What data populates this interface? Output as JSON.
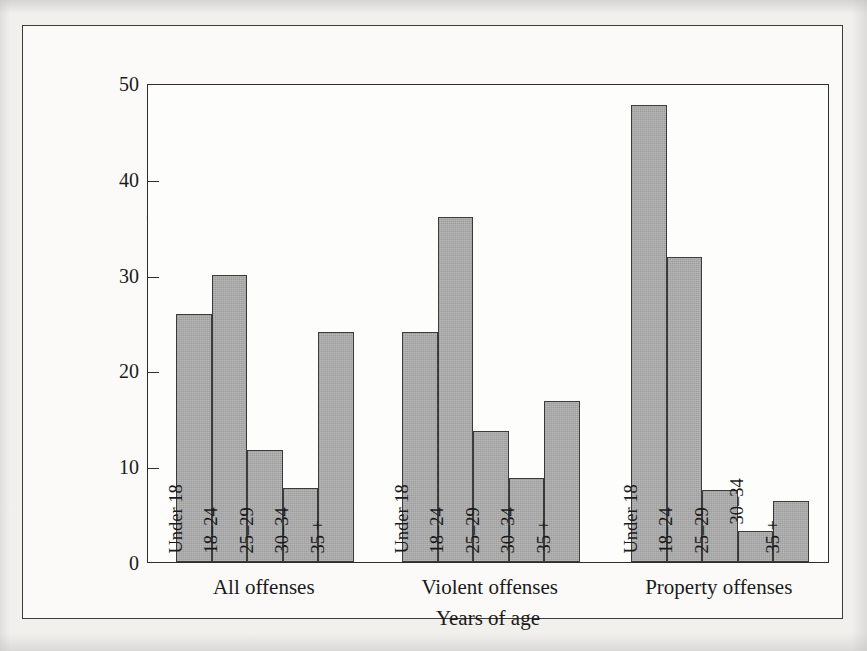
{
  "figure": {
    "caption": ""
  },
  "chart_data": {
    "type": "bar",
    "title": "",
    "xlabel": "Years of age",
    "ylabel": "Percent of total arrests",
    "ylim": [
      0,
      50
    ],
    "yticks": [
      0,
      10,
      20,
      30,
      40,
      50
    ],
    "ytick_labels": [
      "0",
      "10",
      "20",
      "30",
      "40",
      "50"
    ],
    "grid": false,
    "legend": "none",
    "bar_fill_color": "#a9a9a9",
    "bar_edge_color": "#3b3b3b",
    "categories": [
      "Under 18",
      "18–24",
      "25–29",
      "30–34",
      "35 +"
    ],
    "groups": [
      "All offenses",
      "Violent offenses",
      "Property offenses"
    ],
    "series": [
      {
        "name": "All offenses",
        "values": [
          25.9,
          30.0,
          11.7,
          7.7,
          24.0
        ]
      },
      {
        "name": "Violent offenses",
        "values": [
          24.0,
          36.0,
          13.7,
          8.8,
          16.8
        ]
      },
      {
        "name": "Property offenses",
        "values": [
          47.7,
          31.8,
          7.5,
          3.2,
          6.4
        ]
      }
    ],
    "bar_label_placement": [
      [
        "inside",
        "inside",
        "inside",
        "inside",
        "inside"
      ],
      [
        "inside",
        "inside",
        "inside",
        "inside",
        "inside"
      ],
      [
        "inside",
        "inside",
        "inside",
        "outside-above",
        "inside"
      ]
    ]
  }
}
